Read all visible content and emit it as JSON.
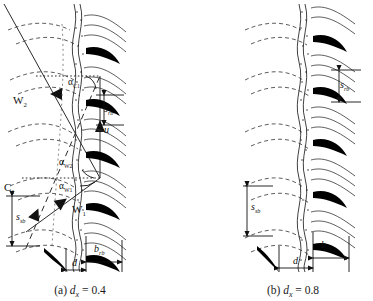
{
  "figure": {
    "type": "turbomachinery-cascade-velocity-triangle",
    "panels": [
      {
        "id": "a",
        "caption_prefix": "(a)",
        "caption_symbol": "d",
        "caption_subscript": "x",
        "caption_equals": "=",
        "caption_value": "0.4",
        "labels": {
          "rotor_pitch": "s",
          "rotor_pitch_sub": "rb",
          "stator_pitch": "s",
          "stator_pitch_sub": "sb",
          "chord": "b",
          "chord_sub": "rb",
          "gap": "d"
        }
      },
      {
        "id": "b",
        "caption_prefix": "(b)",
        "caption_symbol": "d",
        "caption_subscript": "x",
        "caption_equals": "=",
        "caption_value": "0.8",
        "labels": {
          "rotor_pitch": "s",
          "rotor_pitch_sub": "rb",
          "stator_pitch": "s",
          "stator_pitch_sub": "sb",
          "chord": "b",
          "chord_sub": "rb",
          "gap": "d"
        }
      }
    ],
    "velocity_triangle": {
      "vectors": [
        {
          "name": "W",
          "sub": "2",
          "desc": "relative-velocity-outlet"
        },
        {
          "name": "W",
          "sub": "1",
          "desc": "relative-velocity-inlet"
        },
        {
          "name": "C",
          "sub": "1",
          "desc": "absolute-velocity-inlet"
        },
        {
          "name": "u",
          "sub": "",
          "desc": "blade-speed"
        }
      ],
      "angles": [
        {
          "name": "α",
          "sub": "C1",
          "desc": "absolute-flow-angle"
        },
        {
          "name": "α",
          "sub": "W2",
          "desc": "relative-flow-angle-outlet"
        },
        {
          "name": "α",
          "sub": "W1",
          "desc": "relative-flow-angle-inlet"
        }
      ]
    },
    "colors": {
      "ink": "#111111",
      "line": "#2b2b2b",
      "blade_fill": "#000000",
      "background": "#ffffff"
    }
  }
}
